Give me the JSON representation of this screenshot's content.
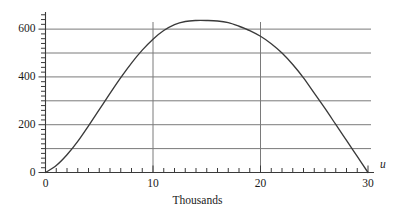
{
  "chart_data": {
    "type": "line",
    "title": "",
    "xlabel": "Thousands",
    "ylabel": "",
    "x_variable_label": "u",
    "xlim": [
      0,
      30
    ],
    "ylim": [
      0,
      680
    ],
    "grid": true,
    "grid_horizontal_values": [
      100,
      200,
      300,
      400,
      500,
      600
    ],
    "grid_vertical_values": [
      10,
      20
    ],
    "legend": "none",
    "x_ticks_major": [
      0,
      10,
      20,
      30
    ],
    "x_tick_labels": [
      "0",
      "10",
      "20",
      "30"
    ],
    "x_minor_tick_step": 1,
    "y_ticks_major": [
      0,
      200,
      400,
      600
    ],
    "y_tick_labels": [
      "0",
      "200",
      "400",
      "600"
    ],
    "y_minor_tick_step": 20,
    "series": [
      {
        "name": "curve",
        "color": "#3a3a3a",
        "x": [
          0,
          1,
          2,
          3,
          4,
          5,
          6,
          7,
          8,
          9,
          10,
          11,
          12,
          13,
          14,
          15,
          16,
          17,
          18,
          19,
          20,
          21,
          22,
          23,
          24,
          25,
          26,
          27,
          28,
          29,
          30
        ],
        "y": [
          0,
          29,
          74,
          130,
          195,
          263,
          331,
          397,
          458,
          512,
          558,
          594,
          619,
          632,
          636,
          636,
          634,
          627,
          612,
          594,
          570,
          539,
          500,
          452,
          396,
          332,
          268,
          201,
          134,
          67,
          0
        ]
      }
    ]
  },
  "axis_colors": {
    "axis_line": "#3a3a3a",
    "grid_line": "#7a7a7a",
    "curve": "#3a3a3a",
    "text": "#1a1a1a"
  }
}
